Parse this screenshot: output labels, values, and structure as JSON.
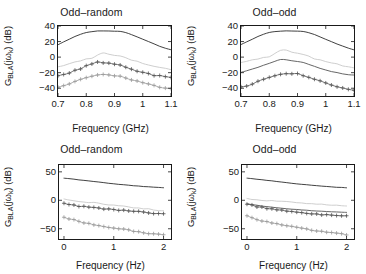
{
  "figure": {
    "background": "#ffffff",
    "panel_count": 4
  },
  "labels": {
    "ylabel_main": "G",
    "ylabel_sub": "BLA",
    "ylabel_arg": "(jω",
    "ylabel_arg_sub": "k",
    "ylabel_unit": ") (dB)",
    "xlabel_ghz": "Frequency (GHz)",
    "xlabel_hz": "Frequency (Hz)",
    "title_odd_random": "Odd–random",
    "title_odd_odd": "Odd–odd"
  },
  "colors": {
    "axis": "#1a1a1a",
    "series_output": "#2b2b2b",
    "series_noise": "#c8c8c8",
    "series_total_distortion": "#555555",
    "series_stochastic": "#9a9a9a"
  },
  "chart_data": [
    {
      "type": "line",
      "panel": "top-left",
      "title": "Odd–random",
      "xlabel": "Frequency (GHz)",
      "ylabel": "G_BLA(jω_k) (dB)",
      "xlim": [
        0.7,
        1.1
      ],
      "ylim": [
        -50,
        40
      ],
      "xticks": [
        0.7,
        0.8,
        0.9,
        1,
        1.1
      ],
      "xtick_labels": [
        "0.7",
        "0.8",
        "0.9",
        "1",
        "1.1"
      ],
      "yticks": [
        40,
        20,
        0,
        -20,
        -40
      ],
      "ytick_labels": [
        "40",
        "20",
        "0",
        "-20",
        "-40"
      ],
      "grid": false,
      "legend": "none",
      "x": [
        0.7,
        0.72,
        0.74,
        0.76,
        0.78,
        0.8,
        0.82,
        0.84,
        0.86,
        0.88,
        0.9,
        0.92,
        0.94,
        0.96,
        0.98,
        1.0,
        1.02,
        1.04,
        1.06,
        1.08,
        1.1
      ],
      "series": [
        {
          "name": "BLA",
          "marker": "none",
          "color": "#2b2b2b",
          "values": [
            16.0,
            19.5,
            23.0,
            26.5,
            29.5,
            31.5,
            32.8,
            33.5,
            33.6,
            33.5,
            33.3,
            33.0,
            31.5,
            29.0,
            26.0,
            23.0,
            20.0,
            17.0,
            14.0,
            11.5,
            9.5
          ]
        },
        {
          "name": "noise-distortion-upper",
          "marker": "none",
          "color": "#c8c8c8",
          "values": [
            -13.0,
            -11.0,
            -9.0,
            -7.0,
            -5.0,
            -3.0,
            -1.5,
            3.5,
            4.5,
            4.0,
            3.0,
            1.0,
            -1.5,
            -4.0,
            -6.0,
            -8.0,
            -10.0,
            -12.0,
            -13.5,
            -15.0,
            -16.0
          ]
        },
        {
          "name": "total-distortion",
          "marker": "plus",
          "color": "#555555",
          "values": [
            -24.0,
            -22.0,
            -20.0,
            -17.5,
            -14.5,
            -11.5,
            -9.0,
            -6.5,
            -7.0,
            -8.0,
            -9.0,
            -10.5,
            -13.0,
            -15.5,
            -17.5,
            -19.5,
            -21.5,
            -23.0,
            -24.5,
            -25.5,
            -26.5
          ]
        },
        {
          "name": "stochastic-nonlinear",
          "marker": "plus",
          "color": "#9a9a9a",
          "values": [
            -38.0,
            -36.0,
            -34.0,
            -31.5,
            -29.0,
            -26.5,
            -24.5,
            -22.5,
            -22.5,
            -23.0,
            -23.5,
            -25.0,
            -27.0,
            -29.0,
            -31.0,
            -33.0,
            -35.0,
            -36.5,
            -38.0,
            -39.0,
            -40.0
          ]
        }
      ]
    },
    {
      "type": "line",
      "panel": "top-right",
      "title": "Odd–odd",
      "xlabel": "Frequency (GHz)",
      "ylabel": "G_BLA(jω_k) (dB)",
      "xlim": [
        0.7,
        1.1
      ],
      "ylim": [
        -50,
        40
      ],
      "xticks": [
        0.7,
        0.8,
        0.9,
        1,
        1.1
      ],
      "xtick_labels": [
        "0.7",
        "0.8",
        "0.9",
        "1",
        "1.1"
      ],
      "yticks": [
        40,
        20,
        0,
        -20,
        -40
      ],
      "ytick_labels": [
        "40",
        "20",
        "0",
        "-20",
        "-40"
      ],
      "grid": false,
      "legend": "none",
      "x": [
        0.7,
        0.72,
        0.74,
        0.76,
        0.78,
        0.8,
        0.82,
        0.84,
        0.86,
        0.88,
        0.9,
        0.92,
        0.94,
        0.96,
        0.98,
        1.0,
        1.02,
        1.04,
        1.06,
        1.08,
        1.1
      ],
      "series": [
        {
          "name": "BLA",
          "marker": "none",
          "color": "#2b2b2b",
          "values": [
            16.0,
            19.5,
            23.0,
            26.5,
            29.5,
            31.5,
            32.8,
            33.5,
            33.6,
            33.5,
            33.3,
            33.0,
            31.5,
            29.0,
            26.0,
            23.0,
            20.0,
            17.0,
            14.0,
            11.5,
            9.5
          ]
        },
        {
          "name": "noise-distortion-upper",
          "marker": "none",
          "color": "#c8c8c8",
          "values": [
            -7.0,
            -5.5,
            -4.0,
            -2.5,
            -1.0,
            0.5,
            4.0,
            9.5,
            9.0,
            7.0,
            5.0,
            3.0,
            0.5,
            -2.0,
            -4.0,
            -6.0,
            -8.0,
            -9.5,
            -11.0,
            -12.0,
            -13.0
          ]
        },
        {
          "name": "total-distortion",
          "marker": "none",
          "color": "#555555",
          "values": [
            -19.5,
            -17.5,
            -15.5,
            -13.0,
            -10.5,
            -8.0,
            -5.5,
            -3.0,
            -3.5,
            -4.5,
            -5.5,
            -7.0,
            -9.5,
            -12.0,
            -14.5,
            -16.5,
            -18.5,
            -20.0,
            -21.5,
            -22.5,
            -23.0
          ]
        },
        {
          "name": "stochastic-nonlinear",
          "marker": "plus",
          "color": "#555555",
          "values": [
            -39.0,
            -36.5,
            -34.0,
            -31.0,
            -28.0,
            -25.5,
            -23.5,
            -21.5,
            -21.0,
            -21.5,
            -22.0,
            -23.5,
            -26.0,
            -28.5,
            -31.0,
            -33.5,
            -36.0,
            -38.0,
            -39.5,
            -41.0,
            -42.0
          ]
        }
      ]
    },
    {
      "type": "line",
      "panel": "bottom-left",
      "title": "Odd–random",
      "xlabel": "Frequency (Hz)",
      "ylabel": "G_BLA(jω_k) (dB)",
      "xlim": [
        -0.1,
        2.15
      ],
      "ylim": [
        -68,
        62
      ],
      "xticks": [
        0,
        1,
        2
      ],
      "xtick_labels": [
        "0",
        "1",
        "2"
      ],
      "yticks": [
        50,
        0,
        -50
      ],
      "ytick_labels": [
        "50",
        "0",
        "-50"
      ],
      "grid": false,
      "legend": "none",
      "x": [
        0.0,
        0.1,
        0.2,
        0.3,
        0.4,
        0.5,
        0.6,
        0.7,
        0.8,
        0.9,
        1.0,
        1.1,
        1.2,
        1.3,
        1.4,
        1.5,
        1.6,
        1.7,
        1.8,
        1.9,
        2.0
      ],
      "series": [
        {
          "name": "BLA",
          "marker": "none",
          "color": "#2b2b2b",
          "values": [
            39.0,
            38.0,
            37.0,
            36.0,
            35.0,
            34.0,
            33.0,
            32.0,
            31.0,
            30.0,
            29.0,
            28.0,
            27.2,
            26.4,
            25.6,
            24.9,
            24.2,
            23.6,
            23.0,
            22.5,
            22.0
          ]
        },
        {
          "name": "noise-distortion-upper",
          "marker": "none",
          "color": "#c8c8c8",
          "values": [
            2.0,
            0.5,
            -0.5,
            -1.5,
            -2.5,
            -3.5,
            -4.5,
            -5.5,
            -6.5,
            -7.5,
            -8.5,
            -9.5,
            -10.5,
            -11.5,
            -12.5,
            -13.5,
            -14.5,
            -15.5,
            -16.5,
            -17.5,
            -18.5
          ]
        },
        {
          "name": "total-distortion",
          "marker": "plus",
          "color": "#555555",
          "values": [
            -5.0,
            -7.0,
            -8.5,
            -10.0,
            -11.0,
            -12.0,
            -13.0,
            -14.0,
            -14.8,
            -15.5,
            -16.2,
            -17.0,
            -17.8,
            -18.5,
            -19.2,
            -20.0,
            -21.0,
            -22.0,
            -22.8,
            -23.5,
            -24.0
          ]
        },
        {
          "name": "stochastic-nonlinear",
          "marker": "plus",
          "color": "#9a9a9a",
          "values": [
            -29.0,
            -32.0,
            -34.5,
            -37.0,
            -39.0,
            -41.0,
            -42.5,
            -44.0,
            -45.5,
            -47.0,
            -48.0,
            -49.5,
            -51.0,
            -52.5,
            -54.0,
            -55.5,
            -57.0,
            -58.0,
            -59.0,
            -60.0,
            -61.0
          ]
        }
      ]
    },
    {
      "type": "line",
      "panel": "bottom-right",
      "title": "Odd–odd",
      "xlabel": "Frequency (Hz)",
      "ylabel": "G_BLA(jω_k) (dB)",
      "xlim": [
        -0.1,
        2.15
      ],
      "ylim": [
        -68,
        62
      ],
      "xticks": [
        0,
        1,
        2
      ],
      "xtick_labels": [
        "0",
        "1",
        "2"
      ],
      "yticks": [
        50,
        0,
        -50
      ],
      "ytick_labels": [
        "50",
        "0",
        "-50"
      ],
      "grid": false,
      "legend": "none",
      "x": [
        0.0,
        0.1,
        0.2,
        0.3,
        0.4,
        0.5,
        0.6,
        0.7,
        0.8,
        0.9,
        1.0,
        1.1,
        1.2,
        1.3,
        1.4,
        1.5,
        1.6,
        1.7,
        1.8,
        1.9,
        2.0
      ],
      "series": [
        {
          "name": "BLA",
          "marker": "none",
          "color": "#2b2b2b",
          "values": [
            39.0,
            38.0,
            37.0,
            36.0,
            35.0,
            34.0,
            33.0,
            32.0,
            31.0,
            30.0,
            29.0,
            28.0,
            27.2,
            26.4,
            25.6,
            24.9,
            24.2,
            23.6,
            23.0,
            22.5,
            22.0
          ]
        },
        {
          "name": "noise-distortion-upper",
          "marker": "none",
          "color": "#c8c8c8",
          "values": [
            2.5,
            1.5,
            0.8,
            0.2,
            -0.4,
            -1.0,
            -1.6,
            -2.2,
            -2.8,
            -3.4,
            -4.0,
            -4.6,
            -5.2,
            -5.8,
            -6.4,
            -7.0,
            -7.6,
            -8.2,
            -8.8,
            -9.4,
            -10.0
          ]
        },
        {
          "name": "total-distortion",
          "marker": "none",
          "color": "#555555",
          "values": [
            -6.0,
            -7.5,
            -8.8,
            -10.0,
            -11.0,
            -12.0,
            -13.0,
            -14.0,
            -14.8,
            -15.5,
            -16.2,
            -17.0,
            -17.6,
            -18.2,
            -18.8,
            -19.3,
            -19.8,
            -20.2,
            -20.6,
            -21.0,
            -21.4
          ]
        },
        {
          "name": "stochastic-nonlinear-plus",
          "marker": "plus",
          "color": "#555555",
          "values": [
            -6.5,
            -9.0,
            -11.0,
            -12.5,
            -14.0,
            -15.5,
            -16.5,
            -17.5,
            -18.5,
            -19.5,
            -20.5,
            -21.5,
            -22.5,
            -23.5,
            -24.5,
            -25.0,
            -25.5,
            -26.0,
            -26.5,
            -27.0,
            -27.5
          ]
        },
        {
          "name": "stochastic-nonlinear",
          "marker": "plus",
          "color": "#9a9a9a",
          "values": [
            -28.0,
            -31.0,
            -33.5,
            -36.0,
            -38.0,
            -40.0,
            -41.5,
            -43.0,
            -44.5,
            -46.0,
            -47.5,
            -49.0,
            -50.5,
            -52.0,
            -53.5,
            -55.0,
            -56.5,
            -57.5,
            -58.5,
            -59.5,
            -60.5
          ]
        }
      ]
    }
  ]
}
